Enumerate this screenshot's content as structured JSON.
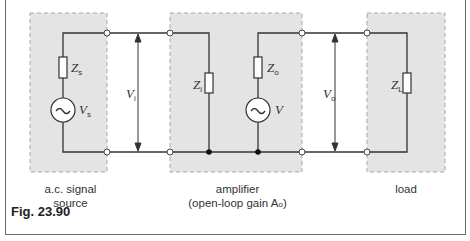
{
  "figure": {
    "caption": "Fig. 23.90",
    "blocks": [
      {
        "id": "source",
        "label_line1": "a.c. signal",
        "label_line2": "source"
      },
      {
        "id": "amplifier",
        "label_line1": "amplifier",
        "label_line2": "(open-loop gain A",
        "label_line2_sub": "o",
        "label_line2_end": ")"
      },
      {
        "id": "load",
        "label_line1": "load"
      }
    ],
    "components": {
      "zs": {
        "main": "Z",
        "sub": "s"
      },
      "vs": {
        "main": "V",
        "sub": "s"
      },
      "vi": {
        "main": "V",
        "sub": "i"
      },
      "zi": {
        "main": "Z",
        "sub": "i"
      },
      "zo": {
        "main": "Z",
        "sub": "o"
      },
      "v": {
        "main": "V",
        "sub": ""
      },
      "vo": {
        "main": "V",
        "sub": "o"
      },
      "zl": {
        "main": "Z",
        "sub": "L"
      }
    },
    "ac_symbol": "~",
    "colors": {
      "box_fill": "#e4e4e4",
      "box_border": "#a8a8a8",
      "wire": "#333333"
    }
  }
}
